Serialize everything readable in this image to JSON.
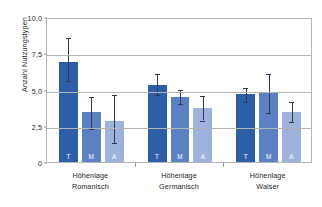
{
  "chart_data": {
    "type": "bar",
    "title": "",
    "xlabel": "",
    "ylabel": "Anzahl Nutzungstypen",
    "ylim": [
      0,
      10
    ],
    "yticks": [
      "0",
      "2,5",
      "5,0",
      "7,5",
      "10,0"
    ],
    "ytick_values": [
      0,
      2.5,
      5.0,
      7.5,
      10.0
    ],
    "grid": "horizontal",
    "legend": "none",
    "categories": [
      "Höhenlage Romanisch",
      "Höhenlage Germanisch",
      "Höhenlage Walser"
    ],
    "group_labels": [
      {
        "line1": "Höhenlage",
        "line2": "Romanisch"
      },
      {
        "line1": "Höhenlage",
        "line2": "Germanisch"
      },
      {
        "line1": "Höhenlage",
        "line2": "Walser"
      }
    ],
    "series": [
      {
        "name": "T",
        "label": "T",
        "color": "#2f5ea8",
        "values": [
          6.9,
          5.3,
          4.7
        ]
      },
      {
        "name": "M",
        "label": "M",
        "color": "#5b81c3",
        "values": [
          3.45,
          4.5,
          4.8
        ]
      },
      {
        "name": "A",
        "label": "A",
        "color": "#9db3dc",
        "values": [
          2.8,
          3.75,
          3.45
        ]
      }
    ],
    "error_bars": [
      {
        "group": "Höhenlage Romanisch",
        "series": "T",
        "value": 6.9,
        "low": 5.7,
        "high": 8.7
      },
      {
        "group": "Höhenlage Romanisch",
        "series": "M",
        "value": 3.45,
        "low": 2.4,
        "high": 4.6
      },
      {
        "group": "Höhenlage Romanisch",
        "series": "A",
        "value": 2.8,
        "low": 1.45,
        "high": 4.75
      },
      {
        "group": "Höhenlage Germanisch",
        "series": "T",
        "value": 5.3,
        "low": 4.75,
        "high": 6.2
      },
      {
        "group": "Höhenlage Germanisch",
        "series": "M",
        "value": 4.5,
        "low": 4.15,
        "high": 5.1
      },
      {
        "group": "Höhenlage Germanisch",
        "series": "A",
        "value": 3.75,
        "low": 3.0,
        "high": 4.7
      },
      {
        "group": "Höhenlage Walser",
        "series": "T",
        "value": 4.7,
        "low": 4.3,
        "high": 5.25
      },
      {
        "group": "Höhenlage Walser",
        "series": "M",
        "value": 4.8,
        "low": 3.55,
        "high": 6.2
      },
      {
        "group": "Höhenlage Walser",
        "series": "A",
        "value": 3.45,
        "low": 2.9,
        "high": 4.25
      }
    ],
    "bar_colors": {
      "T": "#2f5ea8",
      "M": "#5b81c3",
      "A": "#9db3dc"
    },
    "axis_color": "#b5b5b5",
    "error_bar_color": "#2b3a52",
    "text_color": "#1d1d1b"
  }
}
